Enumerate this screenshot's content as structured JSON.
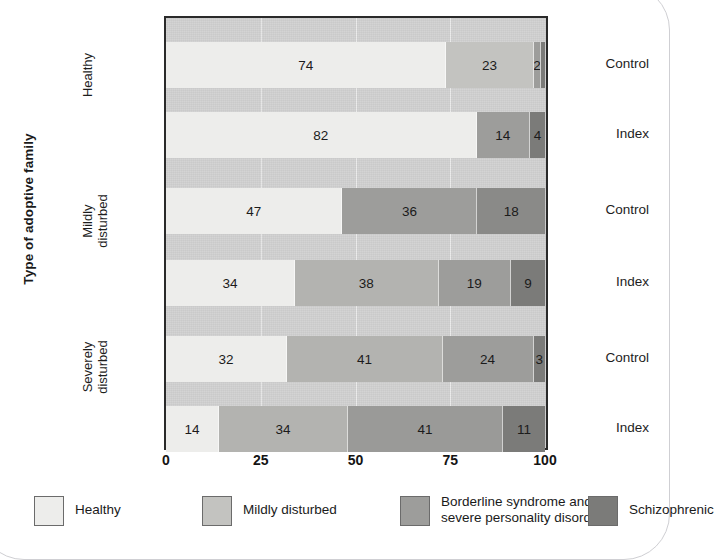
{
  "axis_titles": {
    "y": "Type of adoptive family"
  },
  "series": [
    {
      "name": "Healthy",
      "color": "#ededeb"
    },
    {
      "name": "Mildly disturbed",
      "color": "#c3c3c0"
    },
    {
      "name": "Borderline syndrome and\nsevere personality disorder",
      "color": "#9d9d9b"
    },
    {
      "name": "Schizophrenic",
      "color": "#7b7b79"
    }
  ],
  "groups": [
    {
      "label": "Healthy"
    },
    {
      "label": "Mildly\ndisturbed"
    },
    {
      "label": "Severely\ndisturbed"
    }
  ],
  "rows": [
    {
      "group": "Healthy",
      "label": "Control"
    },
    {
      "group": "Healthy",
      "label": "Index"
    },
    {
      "group": "Mildly disturbed",
      "label": "Control"
    },
    {
      "group": "Mildly disturbed",
      "label": "Index"
    },
    {
      "group": "Severely disturbed",
      "label": "Control"
    },
    {
      "group": "Severely disturbed",
      "label": "Index"
    }
  ],
  "x_ticks": [
    "0",
    "25",
    "50",
    "75",
    "100"
  ],
  "chart_data": {
    "type": "bar",
    "orientation": "horizontal",
    "stacked": true,
    "title": "",
    "xlabel": "",
    "ylabel": "Type of adoptive family",
    "xlim": [
      0,
      100
    ],
    "xticks": [
      0,
      25,
      50,
      75,
      100
    ],
    "grid": true,
    "gridlines_at": [
      25,
      50,
      75
    ],
    "legend_position": "bottom",
    "categories": [
      "Healthy - Control",
      "Healthy - Index",
      "Mildly disturbed - Control",
      "Mildly disturbed - Index",
      "Severely disturbed - Control",
      "Severely disturbed - Index"
    ],
    "series": [
      {
        "name": "Healthy",
        "color": "#ededeb",
        "values": [
          74,
          82,
          47,
          34,
          32,
          14
        ]
      },
      {
        "name": "Mildly disturbed",
        "color": "#c3c3c0",
        "values": [
          23,
          0,
          36,
          38,
          41,
          34
        ]
      },
      {
        "name": "Borderline syndrome and severe personality disorder",
        "color": "#9d9d9b",
        "values": [
          2,
          14,
          18,
          19,
          24,
          41
        ]
      },
      {
        "name": "Schizophrenic",
        "color": "#7b7b79",
        "values": [
          1,
          4,
          0,
          9,
          3,
          11
        ]
      }
    ],
    "bars": [
      {
        "category": "Healthy - Control",
        "segments": [
          {
            "series": "Healthy",
            "value": 74,
            "label": "74",
            "color": "#ededeb"
          },
          {
            "series": "Mildly disturbed",
            "value": 23,
            "label": "23",
            "color": "#c3c3c0"
          },
          {
            "series": "Borderline syndrome and severe personality disorder",
            "value": 2,
            "label": "2",
            "color": "#9d9d9b"
          },
          {
            "series": "Schizophrenic",
            "value": 1,
            "label": "",
            "color": "#7b7b79"
          }
        ]
      },
      {
        "category": "Healthy - Index",
        "segments": [
          {
            "series": "Healthy",
            "value": 82,
            "label": "82",
            "color": "#ededeb"
          },
          {
            "series": "Borderline syndrome and severe personality disorder",
            "value": 14,
            "label": "14",
            "color": "#9d9d9b"
          },
          {
            "series": "Schizophrenic",
            "value": 4,
            "label": "4",
            "color": "#7b7b79"
          }
        ]
      },
      {
        "category": "Mildly disturbed - Control",
        "segments": [
          {
            "series": "Healthy",
            "value": 47,
            "label": "47",
            "color": "#ededeb"
          },
          {
            "series": "Borderline syndrome and severe personality disorder",
            "value": 36,
            "label": "36",
            "color": "#9d9d9b"
          },
          {
            "series": "Schizophrenic",
            "value": 18,
            "label": "18",
            "color": "#8a8a88"
          }
        ]
      },
      {
        "category": "Mildly disturbed - Index",
        "segments": [
          {
            "series": "Healthy",
            "value": 34,
            "label": "34",
            "color": "#ededeb"
          },
          {
            "series": "Mildly disturbed",
            "value": 38,
            "label": "38",
            "color": "#b3b3b0"
          },
          {
            "series": "Borderline syndrome and severe personality disorder",
            "value": 19,
            "label": "19",
            "color": "#9d9d9b"
          },
          {
            "series": "Schizophrenic",
            "value": 9,
            "label": "9",
            "color": "#7b7b79"
          }
        ]
      },
      {
        "category": "Severely disturbed - Control",
        "segments": [
          {
            "series": "Healthy",
            "value": 32,
            "label": "32",
            "color": "#ededeb"
          },
          {
            "series": "Mildly disturbed",
            "value": 41,
            "label": "41",
            "color": "#b3b3b0"
          },
          {
            "series": "Borderline syndrome and severe personality disorder",
            "value": 24,
            "label": "24",
            "color": "#9d9d9b"
          },
          {
            "series": "Schizophrenic",
            "value": 3,
            "label": "3",
            "color": "#7b7b79"
          }
        ]
      },
      {
        "category": "Severely disturbed - Index",
        "segments": [
          {
            "series": "Healthy",
            "value": 14,
            "label": "14",
            "color": "#ededeb"
          },
          {
            "series": "Mildly disturbed",
            "value": 34,
            "label": "34",
            "color": "#b3b3b0"
          },
          {
            "series": "Borderline syndrome and severe personality disorder",
            "value": 41,
            "label": "41",
            "color": "#9a9a98"
          },
          {
            "series": "Schizophrenic",
            "value": 11,
            "label": "11",
            "color": "#7b7b79"
          }
        ]
      }
    ]
  }
}
